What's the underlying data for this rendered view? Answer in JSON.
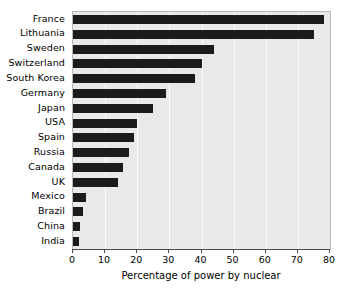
{
  "chart_data": {
    "type": "bar",
    "orientation": "horizontal",
    "title": "",
    "xlabel": "Percentage of power by nuclear",
    "ylabel": "",
    "xlim": [
      0,
      80
    ],
    "ylim": null,
    "xticks": [
      0,
      10,
      20,
      30,
      40,
      50,
      60,
      70,
      80
    ],
    "xtick_labels": [
      "0",
      "10",
      "20",
      "30",
      "40",
      "50",
      "60",
      "70",
      "80"
    ],
    "grid": "vertical",
    "legend": "none",
    "categories": [
      "France",
      "Lithuania",
      "Sweden",
      "Switzerland",
      "South Korea",
      "Germany",
      "Japan",
      "USA",
      "Spain",
      "Russia",
      "Canada",
      "UK",
      "Mexico",
      "Brazil",
      "China",
      "India"
    ],
    "values": [
      78,
      75,
      44,
      40,
      38,
      29,
      25,
      20,
      19,
      17.5,
      15.5,
      14,
      4,
      3,
      2.2,
      2
    ],
    "series": [
      {
        "name": "Percentage of power by nuclear",
        "values": [
          78,
          75,
          44,
          40,
          38,
          29,
          25,
          20,
          19,
          17.5,
          15.5,
          14,
          4,
          3,
          2.2,
          2
        ]
      }
    ]
  },
  "style": {
    "bar_color": "#1b1b1b",
    "plot_background": "#e9e9e9",
    "gridline_color": "#fbfbfb",
    "axis_color": "#4a4a4a",
    "text_color": "#000000",
    "figure_background": "#ffffff"
  }
}
